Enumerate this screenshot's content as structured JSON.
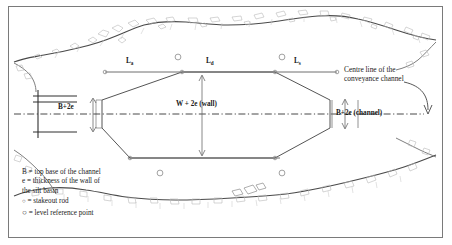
{
  "diagram": {
    "colors": {
      "frame": "#7a7a7a",
      "terrain_line": "#4a4a4a",
      "terrain_hatch": "#b9b9b9",
      "structure_line": "#555555",
      "centre_line": "#333333",
      "marker_circle": "#8a8a8a",
      "baseline": "#6e6e6e"
    },
    "top_labels": [
      {
        "id": "L-a",
        "text": "L",
        "sub": "a",
        "x": 130,
        "y": 62
      },
      {
        "id": "L-d",
        "text": "L",
        "sub": "d",
        "x": 210,
        "y": 62
      },
      {
        "id": "L-s",
        "text": "L",
        "sub": "s",
        "x": 297,
        "y": 62
      }
    ],
    "dimensions": [
      {
        "id": "B-plus-2e-left",
        "text": "B+2e",
        "x": 62,
        "y": 107
      },
      {
        "id": "W-plus-2e-wall",
        "text": "W + 2e (wall)",
        "x": 209,
        "y": 105
      },
      {
        "id": "B-plus-2e-channel",
        "text": "B+2e (channel)",
        "x": 363,
        "y": 113
      }
    ],
    "annotations": [
      {
        "id": "centre-line-note",
        "line1": "Centre line of the",
        "line2": "conveyance channel",
        "x": 344,
        "y": 72
      }
    ],
    "legend": {
      "lines": [
        "B = top base of the channel",
        "e = thickness of the wall of",
        "the silt basin"
      ],
      "keys": [
        {
          "glyph": "○",
          "size": "small",
          "text": "= stakeout rod"
        },
        {
          "glyph": "○",
          "size": "large",
          "text": "= level reference point"
        }
      ]
    },
    "markers": {
      "stakeout_rods": [
        {
          "x": 110,
          "y": 72
        },
        {
          "x": 182,
          "y": 72
        },
        {
          "x": 275,
          "y": 72
        },
        {
          "x": 330,
          "y": 72
        },
        {
          "x": 130,
          "y": 158
        },
        {
          "x": 275,
          "y": 158
        }
      ],
      "level_reference_points": [
        {
          "x": 178,
          "y": 57
        },
        {
          "x": 282,
          "y": 57
        },
        {
          "x": 160,
          "y": 173
        },
        {
          "x": 282,
          "y": 173
        }
      ]
    }
  }
}
